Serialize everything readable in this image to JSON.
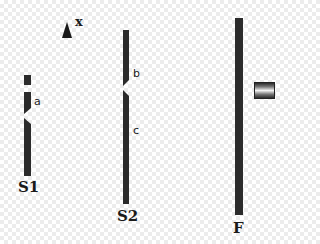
{
  "diagram": {
    "axis": {
      "label": "x",
      "icon": "arrow-up-icon"
    },
    "screens": [
      {
        "name": "S1",
        "slit_label": "a"
      },
      {
        "name": "S2",
        "slit_labels": [
          "b",
          "c"
        ]
      },
      {
        "name": "F"
      }
    ],
    "detector": {
      "icon": "detector-icon"
    },
    "colors": {
      "barrier": "#2b2b2b",
      "background": "#ffffff",
      "checker": "#ececec"
    }
  }
}
